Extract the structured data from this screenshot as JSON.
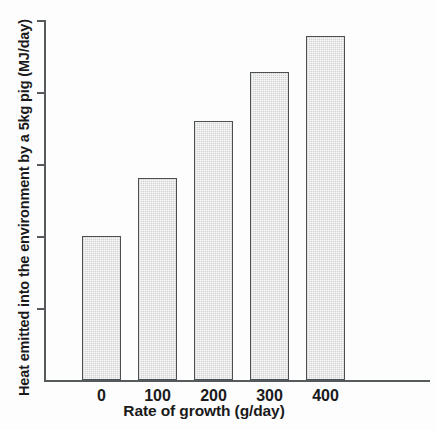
{
  "chart_data": {
    "type": "bar",
    "title": "",
    "xlabel": "Rate of growth (g/day)",
    "ylabel": "Heat emitted into the environment by a 5kg pig (MJ/day)",
    "categories": [
      "0",
      "100",
      "200",
      "300",
      "400"
    ],
    "values": [
      2.0,
      2.8,
      3.6,
      4.28,
      4.78
    ],
    "ylim": [
      0,
      5
    ],
    "y_ticks": [
      "0",
      "1",
      "2",
      "3",
      "4",
      "5"
    ],
    "y_tick_values": [
      0,
      1,
      2,
      3,
      4,
      5
    ],
    "grid": false,
    "legend": null,
    "bar_fill_color": "#ececec",
    "bar_edge_color": "#4a4f51",
    "axis_color": "#555a5c"
  }
}
